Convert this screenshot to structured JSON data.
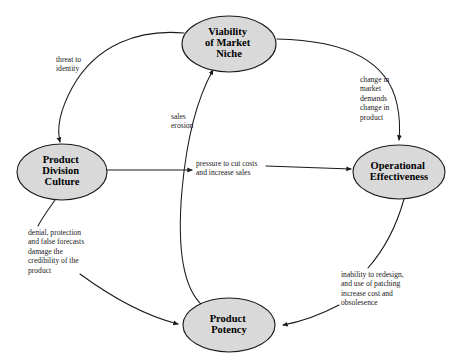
{
  "diagram": {
    "background_color": "#ffffff",
    "node_fill_color": "#d9d9d9",
    "node_stroke_color": "#1a1a1a",
    "text_color": "#1a1a1a",
    "nodes": [
      {
        "id": "viability",
        "name": "viability-of-market-niche",
        "lines": [
          "Viability",
          "of Market",
          "Niche"
        ],
        "cx": 229,
        "cy": 44,
        "rx": 47,
        "ry": 28
      },
      {
        "id": "culture",
        "name": "product-division-culture",
        "lines": [
          "Product",
          "Division",
          "Culture"
        ],
        "cx": 62,
        "cy": 172,
        "rx": 45,
        "ry": 28
      },
      {
        "id": "operational",
        "name": "operational-effectiveness",
        "lines": [
          "Operational",
          "Effectiveness"
        ],
        "cx": 399,
        "cy": 172,
        "rx": 46,
        "ry": 27
      },
      {
        "id": "potency",
        "name": "product-potency",
        "lines": [
          "Product",
          "Potency"
        ],
        "cx": 229,
        "cy": 325,
        "rx": 46,
        "ry": 27
      }
    ],
    "edges": [
      {
        "id": "threat",
        "name": "edge-viability-to-culture",
        "from": "viability",
        "to": "culture",
        "label_lines": [
          "threat to",
          "identity"
        ],
        "label_x": 56,
        "label_y": 62
      },
      {
        "id": "change",
        "name": "edge-viability-to-operational",
        "from": "viability",
        "to": "operational",
        "label_lines": [
          "change in",
          "market",
          "demands",
          "change in",
          "product"
        ],
        "label_x": 360,
        "label_y": 82
      },
      {
        "id": "erosion",
        "name": "edge-potency-to-viability",
        "from": "potency",
        "to": "viability",
        "label_lines": [
          "sales",
          "erosion"
        ],
        "label_x": 171,
        "label_y": 119
      },
      {
        "id": "pressure",
        "name": "edge-culture-to-operational",
        "from": "culture",
        "to": "operational",
        "label_lines": [
          "pressure to cut costs",
          "and increase sales"
        ],
        "label_x": 196,
        "label_y": 166
      },
      {
        "id": "denial",
        "name": "edge-culture-to-potency",
        "from": "culture",
        "to": "potency",
        "label_lines": [
          "denial,  protection",
          "and false forecasts",
          "damage the",
          "credibility of the",
          "product"
        ],
        "label_x": 28,
        "label_y": 235
      },
      {
        "id": "inability",
        "name": "edge-operational-to-potency",
        "from": "operational",
        "to": "potency",
        "label_lines": [
          "inability to redesign,",
          "and use of patching",
          "increase cost and",
          "obsolesence"
        ],
        "label_x": 341,
        "label_y": 277
      }
    ]
  }
}
